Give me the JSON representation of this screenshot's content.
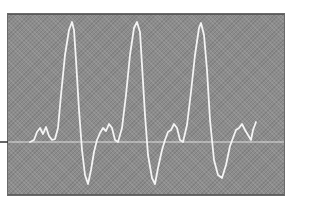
{
  "figure": {
    "colors": {
      "screen": "#8c8c8c",
      "trace": "#f4f4f4",
      "baseline": "#e8e8e8",
      "marker": "#333333",
      "page": "#ffffff"
    },
    "baseline_y": 142,
    "trace_points": "30,142 34,140 37,132 40,128 43,134 46,127 49,136 52,140 55,139 58,128 61,95 65,55 69,30 72,22 74,30 76,60 79,110 82,150 85,175 88,184 91,170 94,152 97,140 100,133 103,128 106,131 109,124 112,128 115,140 118,142 122,128 126,95 130,55 134,28 137,22 140,32 142,65 145,115 148,155 152,178 155,184 158,168 162,150 165,140 168,132 171,130 174,124 177,128 180,140 183,142 187,125 191,92 195,55 199,28 201,23 204,35 207,70 210,120 214,160 218,175 222,178 226,165 230,146 233,138 236,130 239,128 242,124 245,130 248,135 251,140 253,130 256,122"
  },
  "chart_data": {
    "type": "line",
    "title": "",
    "xlabel": "",
    "ylabel": "",
    "series": [
      {
        "name": "waveform",
        "description": "Three cycles: small notched hump near baseline, sharp tall positive spike, deep negative trough, return to baseline",
        "peaks_px": [
          [
            72,
            22
          ],
          [
            137,
            22
          ],
          [
            201,
            23
          ]
        ],
        "troughs_px": [
          [
            88,
            184
          ],
          [
            155,
            184
          ],
          [
            222,
            178
          ]
        ]
      }
    ],
    "grid": false,
    "legend": null
  }
}
